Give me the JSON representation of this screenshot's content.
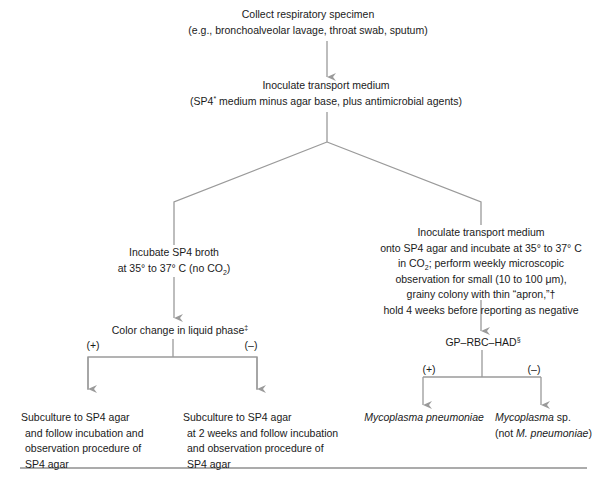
{
  "diagram": {
    "line_color": "#9a9a9a",
    "text_color": "#1a1a1a",
    "nodes": {
      "collect": {
        "line1": "Collect respiratory specimen",
        "line2": "(e.g., bronchoalveolar lavage, throat swab, sputum)"
      },
      "transport": {
        "line1": "Inoculate transport medium",
        "line2_pre": "(SP4",
        "line2_sup": "*",
        "line2_post": " medium minus agar base, plus antimicrobial agents)"
      },
      "broth": {
        "line1": "Incubate SP4 broth",
        "line2_pre": "at 35° to 37° C (no CO",
        "line2_sub": "2",
        "line2_post": ")"
      },
      "color_change": {
        "text": "Color change in liquid phase",
        "sup": "‡"
      },
      "agar": {
        "line1": "Inoculate transport medium",
        "line2": "onto SP4 agar and incubate at 35° to 37° C",
        "line3_pre": "in CO",
        "line3_sub": "2",
        "line3_post": "; perform weekly microscopic",
        "line4": "observation for small (10 to 100 μm),",
        "line5": "grainy colony with thin “apron,”†",
        "line6": "hold 4 weeks before reporting as negative"
      },
      "gp_rbc_had": {
        "text": "GP–RBC–HAD",
        "sup": "§"
      },
      "subculture_pos": {
        "line1": "Subculture to SP4 agar",
        "line2": "and follow incubation and",
        "line3": "observation procedure of",
        "line4": "SP4 agar"
      },
      "subculture_neg": {
        "line1": "Subculture to SP4 agar",
        "line2": "at 2 weeks and follow incubation",
        "line3": "and observation procedure of",
        "line4": "SP4 agar"
      },
      "m_pneumoniae": {
        "text": "Mycoplasma pneumoniae"
      },
      "mycoplasma_sp": {
        "line1_italic": "Mycoplasma",
        "line1_rest": " sp.",
        "line2_pre": "(not ",
        "line2_italic": "M. pneumoniae",
        "line2_post": ")"
      }
    },
    "branch_labels": {
      "color_pos": "(+)",
      "color_neg": "(–)",
      "had_pos": "(+)",
      "had_neg": "(–)"
    }
  }
}
